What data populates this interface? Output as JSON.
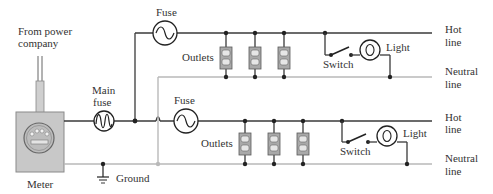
{
  "diagram": {
    "labels": {
      "from_power": [
        "From power",
        "company"
      ],
      "main_fuse": [
        "Main",
        "fuse"
      ],
      "fuse_top": "Fuse",
      "fuse_bottom": "Fuse",
      "outlets_top": "Outlets",
      "outlets_bottom": "Outlets",
      "switch_top": "Switch",
      "switch_bottom": "Switch",
      "light_top": "Light",
      "light_bottom": "Light",
      "hot_line_top": [
        "Hot",
        "line"
      ],
      "neutral_line_top": [
        "Neutral",
        "line"
      ],
      "hot_line_bottom": [
        "Hot",
        "line"
      ],
      "neutral_line_bottom": [
        "Neutral",
        "line"
      ],
      "meter": "Meter",
      "ground": "Ground"
    },
    "colors": {
      "hot_wire": "#3a3a3a",
      "neutral_wire": "#b9b9b9",
      "meter_box": "#c8c8c8",
      "outlet": "#a9a9a9"
    },
    "icons": {
      "meter": "electric-meter-icon",
      "fuse": "fuse-icon",
      "outlet": "outlet-icon",
      "switch": "switch-icon",
      "light": "light-bulb-icon",
      "ground": "ground-icon"
    }
  }
}
